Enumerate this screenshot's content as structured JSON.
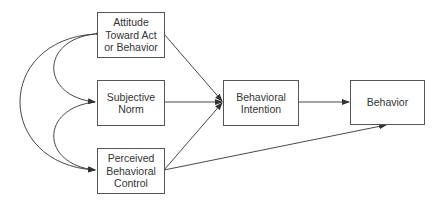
{
  "diagram": {
    "nodes": [
      {
        "id": "attitude",
        "label": "Attitude\nToward Act\nor Behavior"
      },
      {
        "id": "norm",
        "label": "Subjective\nNorm"
      },
      {
        "id": "pbc",
        "label": "Perceived\nBehavioral\nControl"
      },
      {
        "id": "intention",
        "label": "Behavioral\nIntention"
      },
      {
        "id": "behavior",
        "label": "Behavior"
      }
    ],
    "edges": [
      {
        "from": "attitude",
        "to": "intention"
      },
      {
        "from": "norm",
        "to": "intention"
      },
      {
        "from": "pbc",
        "to": "intention"
      },
      {
        "from": "intention",
        "to": "behavior"
      },
      {
        "from": "pbc",
        "to": "behavior"
      },
      {
        "from": "attitude",
        "to": "norm",
        "type": "correlation"
      },
      {
        "from": "norm",
        "to": "pbc",
        "type": "correlation"
      },
      {
        "from": "attitude",
        "to": "pbc",
        "type": "correlation"
      }
    ],
    "colors": {
      "line": "#333333",
      "border": "#555555",
      "text": "#333333"
    }
  }
}
